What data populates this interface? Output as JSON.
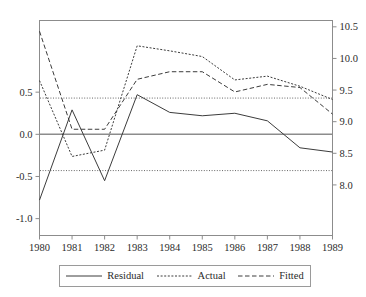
{
  "chart_data": {
    "type": "line",
    "title": "",
    "subtitle": "",
    "xlabel": "",
    "ylabel": "",
    "grid": false,
    "legend_position": "bottom",
    "x": [
      1980,
      1981,
      1982,
      1983,
      1984,
      1985,
      1986,
      1987,
      1988,
      1989
    ],
    "categories": [
      "1980",
      "1981",
      "1982",
      "1983",
      "1984",
      "1985",
      "1986",
      "1987",
      "1988",
      "1989"
    ],
    "left_axis": {
      "name": "Residual",
      "ticks": [
        "0.5",
        "0.0",
        "-0.5",
        "-1.0"
      ],
      "tick_values": [
        0.5,
        0.0,
        -0.5,
        -1.0
      ],
      "ylim": [
        -1.2,
        1.35
      ]
    },
    "right_axis": {
      "name": "Actual / Fitted",
      "ticks": [
        "10.5",
        "10.0",
        "9.5",
        "9.0",
        "8.5",
        "8.0"
      ],
      "tick_values": [
        10.5,
        10.0,
        9.5,
        9.0,
        8.5,
        8.0
      ],
      "ylim": [
        7.2,
        10.6
      ]
    },
    "series": [
      {
        "name": "Residual",
        "axis": "left",
        "style": "solid",
        "color": "#3c3c3c",
        "values": [
          -0.78,
          0.29,
          -0.55,
          0.47,
          0.26,
          0.22,
          0.25,
          0.16,
          -0.16,
          -0.21
        ]
      },
      {
        "name": "Actual",
        "axis": "right",
        "style": "dotted",
        "color": "#3c3c3c",
        "values": [
          9.65,
          8.45,
          8.55,
          10.2,
          10.12,
          10.03,
          9.66,
          9.72,
          9.56,
          9.35
        ]
      },
      {
        "name": "Fitted",
        "axis": "right",
        "style": "dashed",
        "color": "#3c3c3c",
        "values": [
          10.43,
          8.88,
          8.88,
          9.67,
          9.79,
          9.79,
          9.47,
          9.59,
          9.54,
          9.12
        ]
      }
    ],
    "reference_lines": [
      {
        "name": "zero-line",
        "axis": "left",
        "value": 0.0,
        "style": "solid"
      },
      {
        "name": "upper-band",
        "axis": "left",
        "value": 0.43,
        "style": "dotted"
      },
      {
        "name": "lower-band",
        "axis": "left",
        "value": -0.43,
        "style": "dotted"
      }
    ]
  },
  "legend": {
    "entries": [
      {
        "label": "Residual",
        "style": "solid"
      },
      {
        "label": "Actual",
        "style": "dotted"
      },
      {
        "label": "Fitted",
        "style": "dashed"
      }
    ]
  },
  "colors": {
    "line": "#3c3c3c",
    "axis": "#8c8c8c",
    "text": "#2b2b2b",
    "background": "#ffffff"
  }
}
